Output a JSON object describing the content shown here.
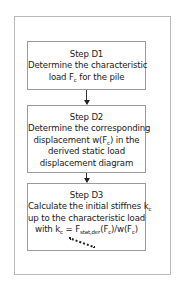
{
  "diagram": {
    "type": "flowchart",
    "steps": [
      {
        "title": "Step D1",
        "lines": [
          "Determine the characteristic",
          "load F",
          "c",
          " for the pile"
        ]
      },
      {
        "title": "Step D2",
        "lines": [
          "Determine the corresponding",
          "displacement w(F",
          "c",
          ") in the",
          "derived static load",
          "displacement diagram"
        ]
      },
      {
        "title": "Step D3",
        "lines": [
          "Calculate the initial stiffnes k",
          "c",
          "up to the characteristic load",
          "with k",
          "c",
          " = F",
          "stat,der",
          "(F",
          "c",
          ")/w(F",
          "c",
          ")"
        ]
      }
    ],
    "arrows": [
      {
        "from": "Step D1",
        "to": "Step D2"
      },
      {
        "from": "Step D2",
        "to": "Step D3"
      }
    ],
    "continuation": "dashed-line"
  }
}
